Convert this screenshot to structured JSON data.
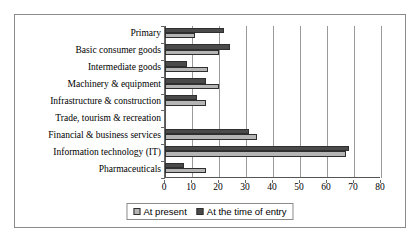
{
  "chart_data": {
    "type": "bar",
    "orientation": "horizontal",
    "title": "",
    "subtitle": "",
    "xlabel": "",
    "ylabel": "",
    "xlim": [
      0,
      80
    ],
    "xticks": [
      0,
      10,
      20,
      30,
      40,
      50,
      60,
      70,
      80
    ],
    "grid": "vertical",
    "legend_position": "bottom",
    "categories": [
      "Primary",
      "Basic consumer goods",
      "Intermediate goods",
      "Machinery & equipment",
      "Infrastructure & construction",
      "Trade, tourism & recreation",
      "Financial & business services",
      "Information technology (IT)",
      "Pharmaceuticals"
    ],
    "series": [
      {
        "name": "At present",
        "color": "#b5b5b5",
        "values": [
          11,
          20,
          16,
          20,
          15,
          0,
          34,
          67,
          15
        ]
      },
      {
        "name": "At the time of entry",
        "color": "#4a4a4a",
        "values": [
          22,
          24,
          8,
          15,
          12,
          0,
          31,
          68,
          7
        ]
      }
    ]
  },
  "legend": {
    "items": [
      {
        "label": "At present",
        "swatch": "present"
      },
      {
        "label": "At the time of entry",
        "swatch": "entry"
      }
    ]
  },
  "colors": {
    "present": "#b5b5b5",
    "entry": "#4a4a4a",
    "frame": "#8a8a8a",
    "axis": "#555555",
    "grid": "#9a9a9a"
  }
}
